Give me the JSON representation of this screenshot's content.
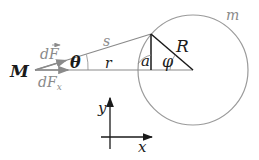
{
  "diagram": {
    "labels": {
      "M": "M",
      "m": "m",
      "s": "s",
      "r": "r",
      "R": "R",
      "theta": "θ",
      "phi": "φ",
      "a": "a",
      "dF": "dF",
      "dFx": "dF",
      "dFx_sub": "x",
      "axis_x": "x",
      "axis_y": "y"
    },
    "colors": {
      "dark": "#1a1a1a",
      "gray": "#8a8a8a",
      "circle": "#9a9a9a"
    }
  }
}
